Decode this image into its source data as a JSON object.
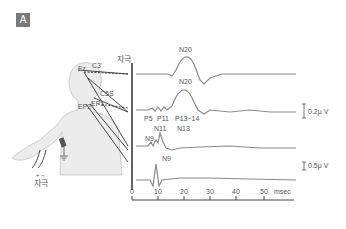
{
  "panel": {
    "badge": "A"
  },
  "figure": {
    "stimulus_label_top": "자극",
    "stimulus_label_bottom": "자극",
    "polarity": "+ −",
    "electrodes": [
      "Fz",
      "C3'",
      "C5S",
      "EP1",
      "EP2"
    ],
    "trace_labels": {
      "trace1": [
        "N20"
      ],
      "trace2": [
        "N20",
        "P5",
        "P11",
        "P13−14"
      ],
      "trace3": [
        "N11",
        "N13",
        "N9"
      ],
      "trace4": [
        "N9"
      ]
    },
    "scale_bars": [
      {
        "label": "0.2μ V",
        "polarity": "− +"
      },
      {
        "label": "0.5μ V",
        "polarity": "− +"
      }
    ],
    "x_axis": {
      "ticks": [
        "0",
        "10",
        "20",
        "30",
        "40",
        "50"
      ],
      "unit": "msec"
    },
    "colors": {
      "trace": "#8a8a8a",
      "axis": "#333333",
      "body": "#e8e8e8",
      "badge": "#7a7a7a"
    }
  }
}
